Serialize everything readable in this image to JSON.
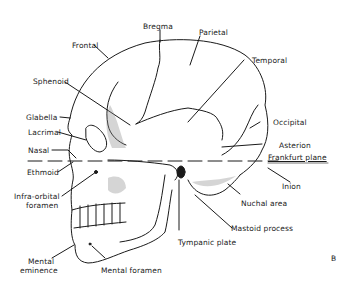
{
  "figure_letter": "B",
  "labels": {
    "bregma": "Bregma",
    "parietal": "Parietal",
    "frontal": "Frontal",
    "temporal": "Temporal",
    "sphenoid": "Sphenoid",
    "occipital": "Occipital",
    "glabella": "Glabella",
    "lacrimal": "Lacrimal",
    "asterion": "Asterion",
    "nasal": "Nasal",
    "frankfurt_plane": "Frankfurt plane",
    "ethmoid": "Ethmoid",
    "inion": "Inion",
    "infra_orbital_1": "Infra-orbital",
    "infra_orbital_2": "foramen",
    "nuchal_area": "Nuchal area",
    "mastoid_process": "Mastoid process",
    "tympanic_plate": "Tympanic plate",
    "mental_eminence_1": "Mental",
    "mental_eminence_2": "eminence",
    "mental_foramen": "Mental foramen"
  },
  "colors": {
    "ink": "#1a1a1a",
    "background": "#ffffff"
  }
}
